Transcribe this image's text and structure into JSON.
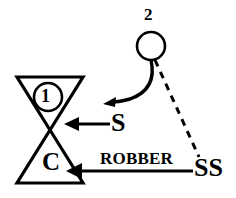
{
  "diagram": {
    "background_color": "#ffffff",
    "stroke_color": "#000000",
    "nodes": [
      {
        "id": "node-2",
        "shape": "circle",
        "label": "2",
        "label_position": "above",
        "cx": 151,
        "cy": 46,
        "r": 14
      },
      {
        "id": "node-1",
        "shape": "circle",
        "label": "1",
        "label_position": "inside",
        "cx": 48,
        "cy": 97,
        "r": 14
      },
      {
        "id": "node-c",
        "shape": "triangle-up",
        "label": "C",
        "label_position": "inside"
      }
    ],
    "bowtie": {
      "left_x": 17,
      "right_x": 83,
      "top_y": 77,
      "bottom_y": 183,
      "center_x": 50,
      "center_y": 130
    },
    "edges": [
      {
        "id": "edge-curved",
        "style": "solid-curved",
        "label": "",
        "from": "node-2",
        "to": "bowtie-upper"
      },
      {
        "id": "edge-s",
        "style": "solid-straight",
        "label": "S",
        "from": "S",
        "to": "bowtie-center"
      },
      {
        "id": "edge-robber",
        "style": "solid-straight",
        "label": "ROBBER",
        "from": "SS",
        "to": "node-c"
      },
      {
        "id": "edge-dashed",
        "style": "dashed",
        "label": "",
        "from": "node-2",
        "to": "SS"
      }
    ],
    "labels": {
      "node_2": "2",
      "node_1": "1",
      "node_c": "C",
      "edge_s": "S",
      "edge_ss": "SS",
      "edge_robber": "ROBBER"
    }
  }
}
